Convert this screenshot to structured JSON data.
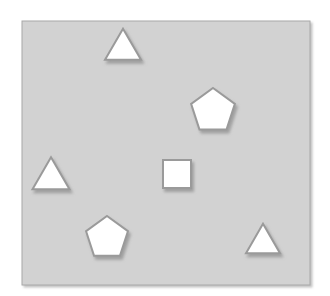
{
  "scene": {
    "title": "shapes-scene",
    "width": 330,
    "height": 296,
    "background_color": "#ffffff",
    "panel": {
      "name": "shape-panel",
      "x": 22,
      "y": 21,
      "width": 288,
      "height": 264,
      "fill_color": "#d2d2d2",
      "border_color": "#a8a8a8",
      "border_width": 1,
      "shadow_color": "#bdbdbd"
    },
    "shape_style": {
      "fill_color": "#ffffff",
      "stroke_color": "#9a9a9a",
      "stroke_width": 2,
      "shadow_color": "#9e9e9e",
      "shadow_offset_x": 2,
      "shadow_offset_y": 3,
      "shadow_blur": 2
    },
    "shape_count": 6,
    "shapes": [
      {
        "id": "triangle-top",
        "kind": "triangle",
        "label": "triangle",
        "center_x": 123,
        "center_y": 48,
        "size": 36,
        "rotation": 0
      },
      {
        "id": "pentagon-right",
        "kind": "pentagon",
        "label": "pentagon",
        "center_x": 213,
        "center_y": 111,
        "size": 23,
        "rotation": 0
      },
      {
        "id": "triangle-left",
        "kind": "triangle",
        "label": "triangle",
        "center_x": 51,
        "center_y": 177,
        "size": 37,
        "rotation": 0
      },
      {
        "id": "square-center",
        "kind": "square",
        "label": "square",
        "center_x": 177,
        "center_y": 174,
        "size": 28,
        "rotation": 0
      },
      {
        "id": "pentagon-bottom",
        "kind": "pentagon",
        "label": "pentagon",
        "center_x": 107,
        "center_y": 238,
        "size": 22,
        "rotation": 0
      },
      {
        "id": "triangle-bottom-right",
        "kind": "triangle",
        "label": "triangle",
        "center_x": 263,
        "center_y": 242,
        "size": 34,
        "rotation": 0
      }
    ]
  }
}
